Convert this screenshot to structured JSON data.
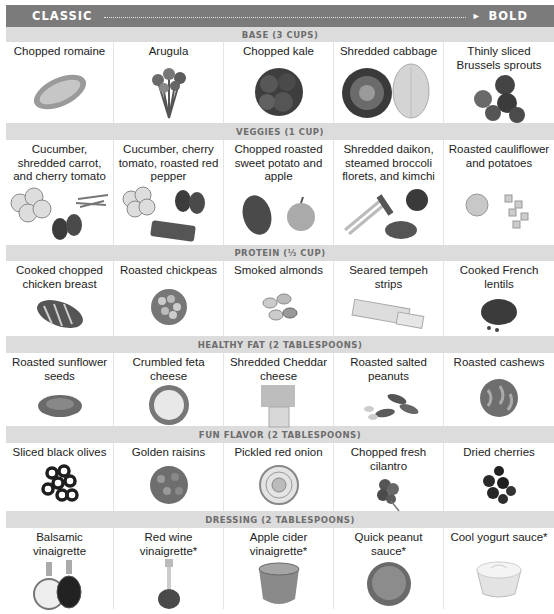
{
  "header": {
    "left_label": "CLASSIC",
    "right_label": "BOLD",
    "arrow_icon": "arrow-right-icon"
  },
  "sections": [
    {
      "title": "BASE (3 CUPS)",
      "items": [
        {
          "label": "Chopped romaine",
          "icon": "romaine-icon"
        },
        {
          "label": "Arugula",
          "icon": "arugula-icon"
        },
        {
          "label": "Chopped kale",
          "icon": "kale-icon"
        },
        {
          "label": "Shredded cabbage",
          "icon": "cabbage-icon"
        },
        {
          "label": "Thinly sliced Brussels sprouts",
          "icon": "brussels-sprouts-icon"
        }
      ]
    },
    {
      "title": "VEGGIES (1 CUP)",
      "items": [
        {
          "label": "Cucumber, shredded carrot, and cherry tomato",
          "icon": "cucumber-carrot-tomato-icon"
        },
        {
          "label": "Cucumber, cherry tomato, roasted red pepper",
          "icon": "cucumber-tomato-pepper-icon"
        },
        {
          "label": "Chopped roasted sweet potato and apple",
          "icon": "sweet-potato-apple-icon"
        },
        {
          "label": "Shredded daikon, steamed broccoli florets, and kimchi",
          "icon": "daikon-broccoli-kimchi-icon"
        },
        {
          "label": "Roasted cauliflower and potatoes",
          "icon": "cauliflower-potatoes-icon"
        }
      ]
    },
    {
      "title": "PROTEIN (⅓ CUP)",
      "items": [
        {
          "label": "Cooked chopped chicken breast",
          "icon": "chicken-breast-icon"
        },
        {
          "label": "Roasted chickpeas",
          "icon": "chickpeas-icon"
        },
        {
          "label": "Smoked almonds",
          "icon": "almonds-icon"
        },
        {
          "label": "Seared tempeh strips",
          "icon": "tempeh-icon"
        },
        {
          "label": "Cooked French lentils",
          "icon": "lentils-icon"
        }
      ]
    },
    {
      "title": "HEALTHY FAT (2 TABLESPOONS)",
      "items": [
        {
          "label": "Roasted sunflower seeds",
          "icon": "sunflower-seeds-icon"
        },
        {
          "label": "Crumbled feta cheese",
          "icon": "feta-icon"
        },
        {
          "label": "Shredded Cheddar cheese",
          "icon": "cheddar-icon"
        },
        {
          "label": "Roasted salted peanuts",
          "icon": "peanuts-icon"
        },
        {
          "label": "Roasted cashews",
          "icon": "cashews-icon"
        }
      ]
    },
    {
      "title": "FUN FLAVOR (2 TABLESPOONS)",
      "items": [
        {
          "label": "Sliced black olives",
          "icon": "olives-icon"
        },
        {
          "label": "Golden raisins",
          "icon": "raisins-icon"
        },
        {
          "label": "Pickled red onion",
          "icon": "red-onion-icon"
        },
        {
          "label": "Chopped fresh cilantro",
          "icon": "cilantro-icon"
        },
        {
          "label": "Dried cherries",
          "icon": "dried-cherries-icon"
        }
      ]
    },
    {
      "title": "DRESSING (2 TABLESPOONS)",
      "items": [
        {
          "label": "Balsamic vinaigrette",
          "icon": "balsamic-bottles-icon"
        },
        {
          "label": "Red wine vinaigrette*",
          "icon": "red-wine-vinaigrette-icon"
        },
        {
          "label": "Apple cider vinaigrette*",
          "icon": "apple-cider-vinaigrette-icon"
        },
        {
          "label": "Quick peanut sauce*",
          "icon": "peanut-sauce-icon"
        },
        {
          "label": "Cool yogurt sauce*",
          "icon": "yogurt-sauce-icon"
        }
      ]
    }
  ],
  "colors": {
    "header_bg": "#7b7b7b",
    "section_bg": "#dcdcdc",
    "section_text": "#6d6d6d"
  }
}
